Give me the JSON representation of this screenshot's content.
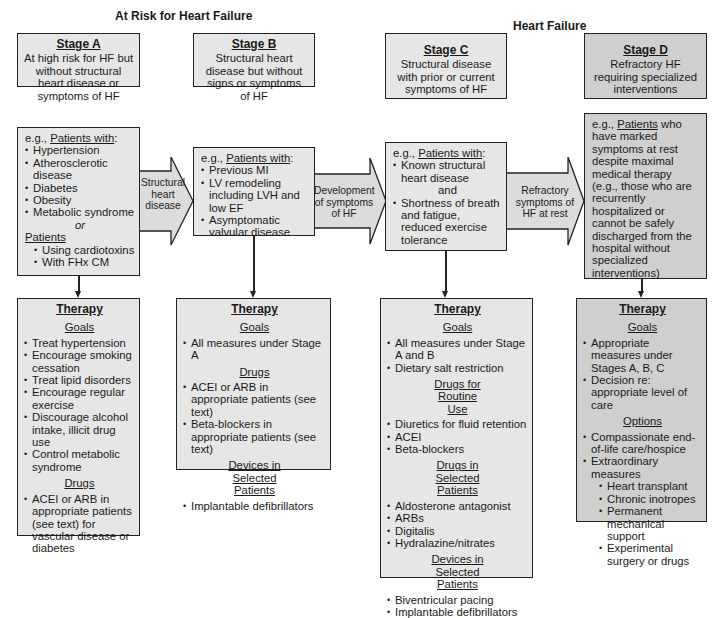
{
  "headers": {
    "at_risk": "At Risk for Heart Failure",
    "heart_failure": "Heart Failure"
  },
  "colors": {
    "box_fill": "#e6e6e6",
    "stage_d_fill": "#cfcfcf",
    "border": "#222222",
    "arrow_fill": "#dcdcdc"
  },
  "stages": [
    {
      "title": "Stage A",
      "desc": "At high risk for HF but without structural heart disease or symptoms of HF",
      "patients": {
        "lead_prefix": "e.g., ",
        "lead_underlined": "Patients with",
        "lead_suffix": ":",
        "items": [
          "Hypertension",
          "Atherosclerotic disease",
          "Diabetes",
          "Obesity",
          "Metabolic syndrome"
        ],
        "connector": "or",
        "group2_title": "Patients",
        "group2_items": [
          "Using cardiotoxins",
          "With FHx CM"
        ]
      },
      "therapy": {
        "title": "Therapy",
        "sections": [
          {
            "heading": "Goals",
            "items": [
              "Treat hypertension",
              "Encourage smoking cessation",
              "Treat lipid disorders",
              "Encourage regular exercise",
              "Discourage alcohol intake, illicit drug use",
              "Control metabolic syndrome"
            ]
          },
          {
            "heading": "Drugs",
            "items": [
              "ACEI or ARB in appropriate patients (see text) for vascular disease or diabetes"
            ]
          }
        ]
      }
    },
    {
      "title": "Stage B",
      "desc": "Structural heart disease but without signs or symptoms of HF",
      "patients": {
        "lead_prefix": "e.g., ",
        "lead_underlined": "Patients with",
        "lead_suffix": ":",
        "items": [
          "Previous MI",
          "LV remodeling including LVH and low EF",
          "Asymptomatic valvular disease"
        ]
      },
      "therapy": {
        "title": "Therapy",
        "sections": [
          {
            "heading": "Goals",
            "items": [
              "All measures under Stage A"
            ]
          },
          {
            "heading": "Drugs",
            "items": [
              "ACEI or ARB in appropriate patients (see text)",
              "Beta-blockers in appropriate patients (see text)"
            ]
          },
          {
            "heading": "Devices in Selected Patients",
            "items": [
              "Implantable defibrillators"
            ]
          }
        ]
      }
    },
    {
      "title": "Stage C",
      "desc": "Structural disease with prior or current symptoms of HF",
      "patients": {
        "lead_prefix": "e.g., ",
        "lead_underlined": "Patients with",
        "lead_suffix": ":",
        "items": [
          "Known structural heart disease"
        ],
        "connector": "and",
        "items2": [
          "Shortness of breath and fatigue, reduced exercise tolerance"
        ]
      },
      "therapy": {
        "title": "Therapy",
        "sections": [
          {
            "heading": "Goals",
            "items": [
              "All measures under Stage A and B",
              "Dietary salt restriction"
            ]
          },
          {
            "heading": "Drugs for Routine Use",
            "items": [
              "Diuretics for fluid retention",
              "ACEI",
              "Beta-blockers"
            ]
          },
          {
            "heading": "Drugs in Selected Patients",
            "items": [
              "Aldosterone antagonist",
              "ARBs",
              "Digitalis",
              "Hydralazine/nitrates"
            ]
          },
          {
            "heading": "Devices in Selected Patients",
            "items": [
              "Biventricular pacing",
              "Implantable defibrillators"
            ]
          }
        ]
      }
    },
    {
      "title": "Stage D",
      "desc": "Refractory HF requiring specialized interventions",
      "patients": {
        "lead_prefix": "e.g., ",
        "lead_underlined": "Patients",
        "lead_suffix": " who have marked symptoms at rest despite maximal medical therapy (e.g., those who are recurrently hospitalized or cannot be safely discharged from the hospital without specialized interventions)"
      },
      "therapy": {
        "title": "Therapy",
        "sections": [
          {
            "heading": "Goals",
            "items": [
              "Appropriate measures under Stages A, B, C",
              "Decision re: appropriate level of care"
            ]
          },
          {
            "heading": "Options",
            "items": [
              "Compassionate end-of-life care/hospice",
              "Extraordinary measures"
            ],
            "sub_items": [
              "Heart transplant",
              "Chronic inotropes",
              "Permanent mechanical support",
              "Experimental surgery or drugs"
            ]
          }
        ]
      }
    }
  ],
  "transitions": [
    {
      "label": "Structural heart disease"
    },
    {
      "label": "Development of symptoms of HF"
    },
    {
      "label": "Refractory symptoms of HF at rest"
    }
  ]
}
